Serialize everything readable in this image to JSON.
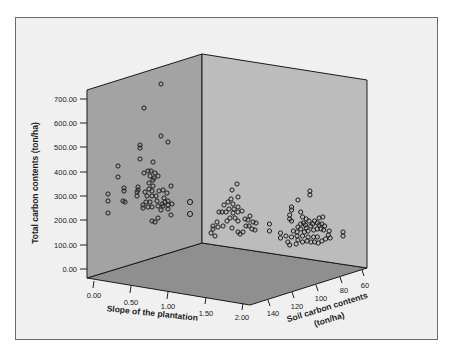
{
  "chart_data": {
    "type": "scatter3d",
    "title": "",
    "axes": {
      "x": {
        "label": "Slope of the plantation",
        "ticks": [
          "0.00",
          "0.50",
          "1.00",
          "1.50",
          "2.00"
        ],
        "range": [
          0,
          2
        ]
      },
      "y": {
        "label": "Total carbon contents (ton/ha)",
        "ticks": [
          "0.00",
          "100.00",
          "200.00",
          "300.00",
          "400.00",
          "500.00",
          "600.00",
          "700.00"
        ],
        "range": [
          0,
          700
        ]
      },
      "z": {
        "label_line1": "Soil carbon contents",
        "label_line2": "(ton/ha)",
        "ticks": [
          "140",
          "120",
          "100",
          "80",
          "60"
        ],
        "range": [
          60,
          140
        ]
      }
    },
    "grid": false,
    "legend": null,
    "marker": "open-circle",
    "clusters": [
      {
        "name": "back-left cluster (near slope 0, high soil carbon)",
        "total_carbon_range": [
          180,
          760
        ],
        "center": 300
      },
      {
        "name": "middle cluster",
        "total_carbon_range": [
          130,
          350
        ],
        "center": 220
      },
      {
        "name": "right cluster (low soil carbon)",
        "total_carbon_range": [
          90,
          300
        ],
        "center": 130
      }
    ],
    "points_screen": [
      [
        161,
        84
      ],
      [
        144,
        108
      ],
      [
        161,
        136
      ],
      [
        168,
        142
      ],
      [
        140,
        145
      ],
      [
        140,
        148
      ],
      [
        140,
        159
      ],
      [
        118,
        166
      ],
      [
        118,
        177
      ],
      [
        153,
        162
      ],
      [
        144,
        173
      ],
      [
        148,
        171
      ],
      [
        151,
        171
      ],
      [
        155,
        173
      ],
      [
        150,
        176
      ],
      [
        154,
        178
      ],
      [
        158,
        176
      ],
      [
        153,
        180
      ],
      [
        149,
        183
      ],
      [
        153,
        186
      ],
      [
        138,
        187
      ],
      [
        138,
        190
      ],
      [
        124,
        188
      ],
      [
        124,
        191
      ],
      [
        137,
        196
      ],
      [
        137,
        192
      ],
      [
        145,
        192
      ],
      [
        149,
        189
      ],
      [
        152,
        191
      ],
      [
        147,
        196
      ],
      [
        152,
        196
      ],
      [
        156,
        196
      ],
      [
        159,
        191
      ],
      [
        163,
        190
      ],
      [
        167,
        193
      ],
      [
        171,
        186
      ],
      [
        164,
        198
      ],
      [
        165,
        202
      ],
      [
        162,
        204
      ],
      [
        157,
        201
      ],
      [
        150,
        202
      ],
      [
        146,
        202
      ],
      [
        143,
        205
      ],
      [
        143,
        208
      ],
      [
        148,
        207
      ],
      [
        152,
        207
      ],
      [
        158,
        206
      ],
      [
        161,
        210
      ],
      [
        163,
        206
      ],
      [
        168,
        201
      ],
      [
        168,
        205
      ],
      [
        168,
        209
      ],
      [
        172,
        204
      ],
      [
        171,
        215
      ],
      [
        152,
        221
      ],
      [
        155,
        222
      ],
      [
        158,
        218
      ],
      [
        108,
        194
      ],
      [
        108,
        201
      ],
      [
        108,
        213
      ],
      [
        125,
        202
      ],
      [
        123,
        201
      ],
      [
        190,
        202
      ],
      [
        190,
        214
      ],
      [
        237,
        184
      ],
      [
        232,
        190
      ],
      [
        238,
        197
      ],
      [
        231,
        199
      ],
      [
        228,
        202
      ],
      [
        233,
        204
      ],
      [
        224,
        205
      ],
      [
        229,
        209
      ],
      [
        234,
        209
      ],
      [
        238,
        207
      ],
      [
        226,
        212
      ],
      [
        233,
        213
      ],
      [
        238,
        212
      ],
      [
        242,
        211
      ],
      [
        222,
        212
      ],
      [
        219,
        212
      ],
      [
        217,
        222
      ],
      [
        213,
        226
      ],
      [
        213,
        229
      ],
      [
        218,
        227
      ],
      [
        223,
        226
      ],
      [
        227,
        221
      ],
      [
        230,
        218
      ],
      [
        235,
        218
      ],
      [
        238,
        221
      ],
      [
        232,
        228
      ],
      [
        238,
        232
      ],
      [
        240,
        234
      ],
      [
        245,
        219
      ],
      [
        248,
        220
      ],
      [
        250,
        216
      ],
      [
        253,
        222
      ],
      [
        249,
        226
      ],
      [
        252,
        229
      ],
      [
        255,
        230
      ],
      [
        256,
        223
      ],
      [
        243,
        232
      ],
      [
        246,
        226
      ],
      [
        215,
        236
      ],
      [
        211,
        233
      ]
    ]
  }
}
